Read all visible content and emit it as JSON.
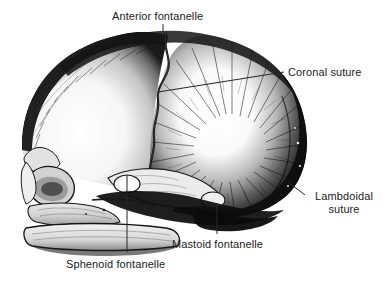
{
  "figure": {
    "background_color": "#ffffff",
    "ink_color": "#1b1b1b",
    "width": 388,
    "height": 282,
    "style": "pen-and-ink engraving / stipple hatching"
  },
  "labels": {
    "anterior_fontanelle": {
      "text": "Anterior fontanelle",
      "x": 112,
      "y": 10
    },
    "coronal_suture": {
      "text": "Coronal suture",
      "x": 288,
      "y": 66
    },
    "lambdoidal_suture": {
      "line1": "Lambdoidal",
      "line2": "suture",
      "x": 307,
      "y": 190
    },
    "mastoid_fontanelle": {
      "text": "Mastoid fontanelle",
      "x": 172,
      "y": 238
    },
    "sphenoid_fontanelle": {
      "text": "Sphenoid fontanelle",
      "x": 66,
      "y": 258
    }
  },
  "leader_lines": {
    "anterior_fontanelle": "vertical line from label down to the vertex of the skull",
    "coronal_suture": "long diagonal line from label left-down to the coronal suture on the parietal bone",
    "lambdoidal_suture": "short diagonal line from the posterior skull margin down-right to the label",
    "mastoid_fontanelle": "vertical line from the mastoid region down to the label",
    "sphenoid_fontanelle": "long vertical line from the sphenoid region down to the label"
  },
  "anatomy": {
    "bones": [
      "frontal bone",
      "parietal bone",
      "occipital bone",
      "temporal bone",
      "maxilla",
      "mandible",
      "nasal bone",
      "zygomatic bone"
    ],
    "fontanelles": [
      "anterior fontanelle",
      "sphenoid fontanelle",
      "mastoid fontanelle"
    ],
    "sutures": [
      "coronal suture",
      "lambdoidal suture"
    ]
  }
}
